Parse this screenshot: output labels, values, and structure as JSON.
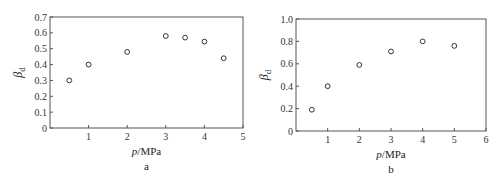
{
  "chart_data": [
    {
      "type": "scatter",
      "panel_label": "a",
      "xlabel": "p/MPa",
      "ylabel": "β_d",
      "xlim": [
        0,
        5
      ],
      "ylim": [
        0,
        0.7
      ],
      "xticks": [
        1,
        2,
        3,
        4,
        5
      ],
      "yticks": [
        0,
        0.1,
        0.2,
        0.3,
        0.4,
        0.5,
        0.6,
        0.7
      ],
      "x": [
        0.5,
        1,
        2,
        3,
        3.5,
        4,
        4.5
      ],
      "y": [
        0.3,
        0.4,
        0.48,
        0.58,
        0.57,
        0.545,
        0.44
      ],
      "grid": false,
      "marker": "open-circle"
    },
    {
      "type": "scatter",
      "panel_label": "b",
      "xlabel": "p/MPa",
      "ylabel": "β_d",
      "xlim": [
        0,
        6
      ],
      "ylim": [
        0,
        1.0
      ],
      "xticks": [
        1,
        2,
        3,
        4,
        5,
        6
      ],
      "yticks": [
        0,
        0.2,
        0.4,
        0.6,
        0.8,
        1.0
      ],
      "x": [
        0.5,
        1,
        2,
        3,
        4,
        5
      ],
      "y": [
        0.19,
        0.4,
        0.59,
        0.71,
        0.8,
        0.76
      ],
      "grid": false,
      "marker": "open-circle"
    }
  ],
  "panels": [
    {
      "label": "a",
      "xlabel_var": "p",
      "xlabel_unit": "/MPa",
      "ylabel_main": "β",
      "ylabel_sub": "d",
      "yticklabels": [
        "0",
        "0.1",
        "0.2",
        "0.3",
        "0.4",
        "0.5",
        "0.6",
        "0.7"
      ],
      "xticklabels": [
        "1",
        "2",
        "3",
        "4",
        "5"
      ]
    },
    {
      "label": "b",
      "xlabel_var": "p",
      "xlabel_unit": "/MPa",
      "ylabel_main": "β",
      "ylabel_sub": "d",
      "yticklabels": [
        "0",
        "0.2",
        "0.4",
        "0.6",
        "0.8",
        "1.0"
      ],
      "xticklabels": [
        "1",
        "2",
        "3",
        "4",
        "5",
        "6"
      ]
    }
  ]
}
